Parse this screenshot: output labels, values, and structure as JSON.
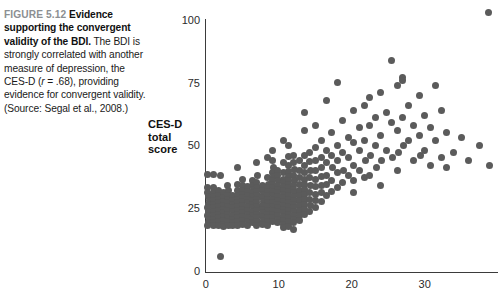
{
  "caption": {
    "figure_number": "FIGURE 5.12",
    "bold_lead": "Evidence supporting the convergent validity of the BDI.",
    "body_part1": " The BDI is strongly correlated with another measure of depression, the CES-D (",
    "body_italic": "r",
    "body_part2": " = .68), providing evidence for convergent validity. (Source: Segal et al., 2008.)"
  },
  "chart_data": {
    "type": "scatter",
    "title": "",
    "xlabel": "",
    "ylabel": "CES-D total score",
    "ylabel_lines": [
      "CES-D",
      "total",
      "score"
    ],
    "xlim": [
      0,
      40
    ],
    "ylim": [
      0,
      105
    ],
    "xticks": [
      0,
      10,
      20,
      30
    ],
    "yticks": [
      0,
      25,
      50,
      75,
      100
    ],
    "xtick_labels": [
      "0",
      "10",
      "20",
      "30"
    ],
    "ytick_labels": [
      "0",
      "25",
      "50",
      "75",
      "100"
    ],
    "grid": false,
    "legend": null,
    "correlation": 0.68,
    "marker_color": "#5b5b5b",
    "marker_size_px": 7,
    "points": [
      [
        2.0,
        5.5
      ],
      [
        0.3,
        38.5
      ],
      [
        1.0,
        38.5
      ],
      [
        2.0,
        38.0
      ],
      [
        0.3,
        33.0
      ],
      [
        0.3,
        31.0
      ],
      [
        0.4,
        29.5
      ],
      [
        0.5,
        28.0
      ],
      [
        0.4,
        26.5
      ],
      [
        0.3,
        25.0
      ],
      [
        0.4,
        23.5
      ],
      [
        0.3,
        22.0
      ],
      [
        0.5,
        20.5
      ],
      [
        0.4,
        19.0
      ],
      [
        0.3,
        17.8
      ],
      [
        1.0,
        33.0
      ],
      [
        1.0,
        31.0
      ],
      [
        1.1,
        29.5
      ],
      [
        1.0,
        28.0
      ],
      [
        1.1,
        26.5
      ],
      [
        1.0,
        25.0
      ],
      [
        1.0,
        23.5
      ],
      [
        1.1,
        22.0
      ],
      [
        1.0,
        20.5
      ],
      [
        1.0,
        19.0
      ],
      [
        1.1,
        17.8
      ],
      [
        1.7,
        32.0
      ],
      [
        1.7,
        30.0
      ],
      [
        1.8,
        28.5
      ],
      [
        1.7,
        27.0
      ],
      [
        1.8,
        25.5
      ],
      [
        1.7,
        24.0
      ],
      [
        1.7,
        22.5
      ],
      [
        1.8,
        21.0
      ],
      [
        1.7,
        19.5
      ],
      [
        1.8,
        18.0
      ],
      [
        2.4,
        31.0
      ],
      [
        2.4,
        29.0
      ],
      [
        2.5,
        27.5
      ],
      [
        2.4,
        26.0
      ],
      [
        2.5,
        24.5
      ],
      [
        2.4,
        23.0
      ],
      [
        2.4,
        21.5
      ],
      [
        2.5,
        20.0
      ],
      [
        2.4,
        18.5
      ],
      [
        2.5,
        17.5
      ],
      [
        3.0,
        34.0
      ],
      [
        3.1,
        32.0
      ],
      [
        3.0,
        30.0
      ],
      [
        3.1,
        28.5
      ],
      [
        3.0,
        27.0
      ],
      [
        3.1,
        25.5
      ],
      [
        3.0,
        24.0
      ],
      [
        3.0,
        22.5
      ],
      [
        3.1,
        21.0
      ],
      [
        3.0,
        19.5
      ],
      [
        3.1,
        18.0
      ],
      [
        3.7,
        30.0
      ],
      [
        3.7,
        28.0
      ],
      [
        3.8,
        26.5
      ],
      [
        3.7,
        25.0
      ],
      [
        3.8,
        23.5
      ],
      [
        3.7,
        22.0
      ],
      [
        3.7,
        20.5
      ],
      [
        3.8,
        19.0
      ],
      [
        3.7,
        17.8
      ],
      [
        4.3,
        41.0
      ],
      [
        4.4,
        34.5
      ],
      [
        4.3,
        32.0
      ],
      [
        4.4,
        30.0
      ],
      [
        4.3,
        28.5
      ],
      [
        4.4,
        27.0
      ],
      [
        4.3,
        25.5
      ],
      [
        4.3,
        24.0
      ],
      [
        4.4,
        22.5
      ],
      [
        4.3,
        21.0
      ],
      [
        4.4,
        19.5
      ],
      [
        4.3,
        18.0
      ],
      [
        5.0,
        36.5
      ],
      [
        5.0,
        34.0
      ],
      [
        5.1,
        32.0
      ],
      [
        5.0,
        30.5
      ],
      [
        5.1,
        29.0
      ],
      [
        5.0,
        27.5
      ],
      [
        5.0,
        26.0
      ],
      [
        5.1,
        24.5
      ],
      [
        5.0,
        23.0
      ],
      [
        5.1,
        21.5
      ],
      [
        5.0,
        20.0
      ],
      [
        5.0,
        18.5
      ],
      [
        5.7,
        33.5
      ],
      [
        5.7,
        31.5
      ],
      [
        5.8,
        30.0
      ],
      [
        5.7,
        28.5
      ],
      [
        5.8,
        27.0
      ],
      [
        5.7,
        25.5
      ],
      [
        5.7,
        24.0
      ],
      [
        5.8,
        22.5
      ],
      [
        5.7,
        21.0
      ],
      [
        5.8,
        19.5
      ],
      [
        5.7,
        18.0
      ],
      [
        6.4,
        36.0
      ],
      [
        6.4,
        34.0
      ],
      [
        6.5,
        32.5
      ],
      [
        6.4,
        31.0
      ],
      [
        6.5,
        29.5
      ],
      [
        6.4,
        28.0
      ],
      [
        6.4,
        26.5
      ],
      [
        6.5,
        25.0
      ],
      [
        6.4,
        23.5
      ],
      [
        6.5,
        22.0
      ],
      [
        6.4,
        20.5
      ],
      [
        6.4,
        19.0
      ],
      [
        7.0,
        43.0
      ],
      [
        7.1,
        38.0
      ],
      [
        7.0,
        35.0
      ],
      [
        7.1,
        33.0
      ],
      [
        7.0,
        31.5
      ],
      [
        7.1,
        30.0
      ],
      [
        7.0,
        28.5
      ],
      [
        7.0,
        27.0
      ],
      [
        7.1,
        25.5
      ],
      [
        7.0,
        24.0
      ],
      [
        7.1,
        22.5
      ],
      [
        7.0,
        21.0
      ],
      [
        7.1,
        19.5
      ],
      [
        7.0,
        18.0
      ],
      [
        7.8,
        34.0
      ],
      [
        7.8,
        32.0
      ],
      [
        7.9,
        30.5
      ],
      [
        7.8,
        29.0
      ],
      [
        7.9,
        27.5
      ],
      [
        7.8,
        26.0
      ],
      [
        7.8,
        24.5
      ],
      [
        7.9,
        23.0
      ],
      [
        7.8,
        21.5
      ],
      [
        7.9,
        20.0
      ],
      [
        7.8,
        18.5
      ],
      [
        8.5,
        45.0
      ],
      [
        8.5,
        37.0
      ],
      [
        8.6,
        34.5
      ],
      [
        8.5,
        33.0
      ],
      [
        8.6,
        31.5
      ],
      [
        8.5,
        30.0
      ],
      [
        8.5,
        28.5
      ],
      [
        8.6,
        27.0
      ],
      [
        8.5,
        25.5
      ],
      [
        8.6,
        24.0
      ],
      [
        8.5,
        22.5
      ],
      [
        8.5,
        21.0
      ],
      [
        8.6,
        19.5
      ],
      [
        8.5,
        18.0
      ],
      [
        9.2,
        48.0
      ],
      [
        9.2,
        44.0
      ],
      [
        9.3,
        41.0
      ],
      [
        9.2,
        39.0
      ],
      [
        9.3,
        37.5
      ],
      [
        9.2,
        36.0
      ],
      [
        9.2,
        34.5
      ],
      [
        9.3,
        33.0
      ],
      [
        9.2,
        31.5
      ],
      [
        9.3,
        30.0
      ],
      [
        9.2,
        28.5
      ],
      [
        9.2,
        27.0
      ],
      [
        9.3,
        25.5
      ],
      [
        9.2,
        24.0
      ],
      [
        9.3,
        22.5
      ],
      [
        9.2,
        21.0
      ],
      [
        9.2,
        19.5
      ],
      [
        9.9,
        40.0
      ],
      [
        9.9,
        38.0
      ],
      [
        10.0,
        36.0
      ],
      [
        9.9,
        34.0
      ],
      [
        10.0,
        32.5
      ],
      [
        9.9,
        31.0
      ],
      [
        9.9,
        29.5
      ],
      [
        10.0,
        28.0
      ],
      [
        9.9,
        26.5
      ],
      [
        10.0,
        25.0
      ],
      [
        9.9,
        23.5
      ],
      [
        9.9,
        22.0
      ],
      [
        10.0,
        20.5
      ],
      [
        9.9,
        19.0
      ],
      [
        10.6,
        52.0
      ],
      [
        10.6,
        43.0
      ],
      [
        10.7,
        39.0
      ],
      [
        10.6,
        36.5
      ],
      [
        10.7,
        35.0
      ],
      [
        10.6,
        33.5
      ],
      [
        10.6,
        32.0
      ],
      [
        10.7,
        30.5
      ],
      [
        10.6,
        29.0
      ],
      [
        10.7,
        27.5
      ],
      [
        10.6,
        26.0
      ],
      [
        10.6,
        24.5
      ],
      [
        10.7,
        23.0
      ],
      [
        10.6,
        21.5
      ],
      [
        10.7,
        20.0
      ],
      [
        10.6,
        18.5
      ],
      [
        10.6,
        17.0
      ],
      [
        11.3,
        50.0
      ],
      [
        11.3,
        45.5
      ],
      [
        11.4,
        42.0
      ],
      [
        11.3,
        39.5
      ],
      [
        11.4,
        37.5
      ],
      [
        11.3,
        36.0
      ],
      [
        11.3,
        34.5
      ],
      [
        11.4,
        33.0
      ],
      [
        11.3,
        31.5
      ],
      [
        11.4,
        30.0
      ],
      [
        11.3,
        28.5
      ],
      [
        11.3,
        27.0
      ],
      [
        11.4,
        25.5
      ],
      [
        11.3,
        24.0
      ],
      [
        11.4,
        22.5
      ],
      [
        11.3,
        21.0
      ],
      [
        11.3,
        19.5
      ],
      [
        11.4,
        17.5
      ],
      [
        12.0,
        46.0
      ],
      [
        12.0,
        43.0
      ],
      [
        12.1,
        40.5
      ],
      [
        12.0,
        38.0
      ],
      [
        12.1,
        36.0
      ],
      [
        12.0,
        34.0
      ],
      [
        12.0,
        32.5
      ],
      [
        12.1,
        31.0
      ],
      [
        12.0,
        29.5
      ],
      [
        12.1,
        28.0
      ],
      [
        12.0,
        26.5
      ],
      [
        12.0,
        25.0
      ],
      [
        12.1,
        23.5
      ],
      [
        12.0,
        22.0
      ],
      [
        12.1,
        20.5
      ],
      [
        12.0,
        19.0
      ],
      [
        12.0,
        16.5
      ],
      [
        12.8,
        44.0
      ],
      [
        12.8,
        40.0
      ],
      [
        12.9,
        37.0
      ],
      [
        12.8,
        34.5
      ],
      [
        12.9,
        32.0
      ],
      [
        12.8,
        30.0
      ],
      [
        12.8,
        28.0
      ],
      [
        12.9,
        26.0
      ],
      [
        12.8,
        24.0
      ],
      [
        12.9,
        22.0
      ],
      [
        12.8,
        20.0
      ],
      [
        13.5,
        63.0
      ],
      [
        13.5,
        56.0
      ],
      [
        13.6,
        46.0
      ],
      [
        13.5,
        42.0
      ],
      [
        13.6,
        39.0
      ],
      [
        13.5,
        36.5
      ],
      [
        13.5,
        34.5
      ],
      [
        13.6,
        32.5
      ],
      [
        13.5,
        30.5
      ],
      [
        13.6,
        28.5
      ],
      [
        13.5,
        26.5
      ],
      [
        13.5,
        24.5
      ],
      [
        13.6,
        22.5
      ],
      [
        14.2,
        47.0
      ],
      [
        14.2,
        43.5
      ],
      [
        14.3,
        40.0
      ],
      [
        14.2,
        37.0
      ],
      [
        14.3,
        34.0
      ],
      [
        14.2,
        31.0
      ],
      [
        14.2,
        28.5
      ],
      [
        14.3,
        26.0
      ],
      [
        14.2,
        23.5
      ],
      [
        15.0,
        58.0
      ],
      [
        15.0,
        49.0
      ],
      [
        15.1,
        44.0
      ],
      [
        15.0,
        40.0
      ],
      [
        15.1,
        36.5
      ],
      [
        15.0,
        33.5
      ],
      [
        15.0,
        30.5
      ],
      [
        15.1,
        28.0
      ],
      [
        15.0,
        25.0
      ],
      [
        15.8,
        52.0
      ],
      [
        15.8,
        45.0
      ],
      [
        15.9,
        41.0
      ],
      [
        15.8,
        37.5
      ],
      [
        15.9,
        34.0
      ],
      [
        15.8,
        31.0
      ],
      [
        15.8,
        27.5
      ],
      [
        16.5,
        68.0
      ],
      [
        16.5,
        48.0
      ],
      [
        16.6,
        43.0
      ],
      [
        16.5,
        38.0
      ],
      [
        16.6,
        34.5
      ],
      [
        16.5,
        30.0
      ],
      [
        17.3,
        55.0
      ],
      [
        17.3,
        46.0
      ],
      [
        17.4,
        41.0
      ],
      [
        17.3,
        36.0
      ],
      [
        17.3,
        31.5
      ],
      [
        18.0,
        75.0
      ],
      [
        18.0,
        50.0
      ],
      [
        18.1,
        44.0
      ],
      [
        18.0,
        39.0
      ],
      [
        18.0,
        33.0
      ],
      [
        18.8,
        60.0
      ],
      [
        18.8,
        47.0
      ],
      [
        18.9,
        40.0
      ],
      [
        18.8,
        35.0
      ],
      [
        19.5,
        53.0
      ],
      [
        19.5,
        45.0
      ],
      [
        19.6,
        38.0
      ],
      [
        20.2,
        64.0
      ],
      [
        20.2,
        51.0
      ],
      [
        20.3,
        42.0
      ],
      [
        20.2,
        36.0
      ],
      [
        20.2,
        31.0
      ],
      [
        21.0,
        57.0
      ],
      [
        21.0,
        48.0
      ],
      [
        21.1,
        40.0
      ],
      [
        21.8,
        66.0
      ],
      [
        21.8,
        52.0
      ],
      [
        21.9,
        44.0
      ],
      [
        21.8,
        37.0
      ],
      [
        22.5,
        69.0
      ],
      [
        22.5,
        58.0
      ],
      [
        22.6,
        46.0
      ],
      [
        22.5,
        38.0
      ],
      [
        23.3,
        61.0
      ],
      [
        23.3,
        50.0
      ],
      [
        23.4,
        41.0
      ],
      [
        24.0,
        71.0
      ],
      [
        24.0,
        54.0
      ],
      [
        24.1,
        44.0
      ],
      [
        24.0,
        34.0
      ],
      [
        24.8,
        63.0
      ],
      [
        24.8,
        48.0
      ],
      [
        25.5,
        84.0
      ],
      [
        25.5,
        59.0
      ],
      [
        25.6,
        45.0
      ],
      [
        26.3,
        74.0
      ],
      [
        26.3,
        56.0
      ],
      [
        26.4,
        47.0
      ],
      [
        26.3,
        40.0
      ],
      [
        27.0,
        77.0
      ],
      [
        27.0,
        76.0
      ],
      [
        27.0,
        61.0
      ],
      [
        27.1,
        50.0
      ],
      [
        27.8,
        66.0
      ],
      [
        27.8,
        52.0
      ],
      [
        28.5,
        58.0
      ],
      [
        28.5,
        44.0
      ],
      [
        29.3,
        70.0
      ],
      [
        29.3,
        54.0
      ],
      [
        29.4,
        46.0
      ],
      [
        30.0,
        62.0
      ],
      [
        30.0,
        48.0
      ],
      [
        30.8,
        57.0
      ],
      [
        30.8,
        42.0
      ],
      [
        31.5,
        74.0
      ],
      [
        31.5,
        52.0
      ],
      [
        32.3,
        64.0
      ],
      [
        32.3,
        45.0
      ],
      [
        33.0,
        55.0
      ],
      [
        33.0,
        41.0
      ],
      [
        34.0,
        47.0
      ],
      [
        35.0,
        53.0
      ],
      [
        36.0,
        44.0
      ],
      [
        37.5,
        50.0
      ],
      [
        38.8,
        103.0
      ],
      [
        38.9,
        42.0
      ]
    ]
  }
}
